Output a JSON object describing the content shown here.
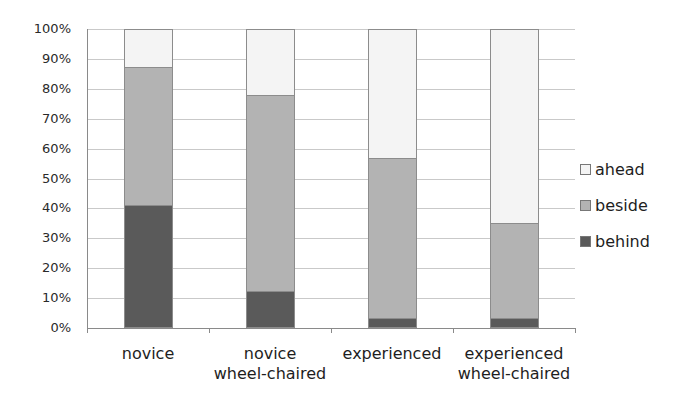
{
  "chart_data": {
    "type": "bar",
    "stacked": true,
    "percent": true,
    "title": "",
    "xlabel": "",
    "ylabel": "",
    "ylim": [
      0,
      100
    ],
    "yticks": [
      "0%",
      "10%",
      "20%",
      "30%",
      "40%",
      "50%",
      "60%",
      "70%",
      "80%",
      "90%",
      "100%"
    ],
    "grid": true,
    "legend_position": "right",
    "categories": [
      "novice",
      "novice\nwheel-chaired",
      "experienced",
      "experienced\nwheel-chaired"
    ],
    "category_lines": [
      [
        "novice"
      ],
      [
        "novice",
        "wheel-chaired"
      ],
      [
        "experienced"
      ],
      [
        "experienced",
        "wheel-chaired"
      ]
    ],
    "series": [
      {
        "name": "behind",
        "color": "#5a5a5a",
        "values": [
          41,
          12.5,
          3.3,
          3.3
        ]
      },
      {
        "name": "beside",
        "color": "#b3b3b3",
        "values": [
          46.3,
          65.5,
          53.7,
          31.7
        ]
      },
      {
        "name": "ahead",
        "color": "#f4f4f4",
        "values": [
          12.7,
          22,
          43,
          65
        ]
      }
    ],
    "legend": [
      {
        "name": "ahead",
        "color": "#f4f4f4"
      },
      {
        "name": "beside",
        "color": "#b3b3b3"
      },
      {
        "name": "behind",
        "color": "#5a5a5a"
      }
    ]
  }
}
